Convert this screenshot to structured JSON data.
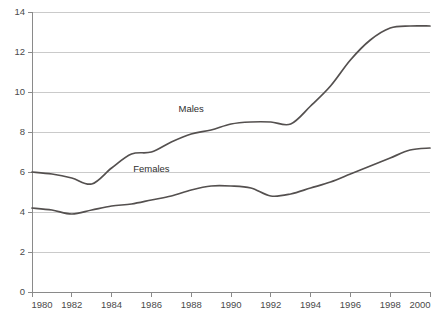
{
  "chart_data": {
    "type": "line",
    "title": "",
    "xlabel": "",
    "ylabel": "",
    "xlim": [
      1980,
      2000
    ],
    "ylim": [
      0,
      14
    ],
    "grid": true,
    "legend_position": "inline-labels",
    "x_ticks": [
      1980,
      1982,
      1984,
      1986,
      1988,
      1990,
      1992,
      1994,
      1996,
      1998,
      2000
    ],
    "y_ticks": [
      0,
      2,
      4,
      6,
      8,
      10,
      12,
      14
    ],
    "x": [
      1980,
      1981,
      1982,
      1983,
      1984,
      1985,
      1986,
      1987,
      1988,
      1989,
      1990,
      1991,
      1992,
      1993,
      1994,
      1995,
      1996,
      1997,
      1998,
      1999,
      2000
    ],
    "series": [
      {
        "name": "Males",
        "color": "#54504f",
        "values": [
          6.0,
          5.9,
          5.7,
          5.4,
          6.2,
          6.9,
          7.0,
          7.5,
          7.9,
          8.1,
          8.4,
          8.5,
          8.5,
          8.4,
          9.3,
          10.3,
          11.6,
          12.6,
          13.2,
          13.3,
          13.3
        ],
        "label_at_x": 1988,
        "label_at_y": 9.0
      },
      {
        "name": "Females",
        "color": "#54504f",
        "values": [
          4.2,
          4.1,
          3.9,
          4.1,
          4.3,
          4.4,
          4.6,
          4.8,
          5.1,
          5.3,
          5.3,
          5.2,
          4.8,
          4.9,
          5.2,
          5.5,
          5.9,
          6.3,
          6.7,
          7.1,
          7.2
        ],
        "label_at_x": 1986,
        "label_at_y": 6.0
      }
    ]
  },
  "axes": {
    "y_tick_labels": [
      "0",
      "2",
      "4",
      "6",
      "8",
      "10",
      "12",
      "14"
    ],
    "x_tick_labels": [
      "1980",
      "1982",
      "1984",
      "1986",
      "1988",
      "1990",
      "1992",
      "1994",
      "1996",
      "1998",
      "2000"
    ]
  },
  "series_labels": {
    "males": "Males",
    "females": "Females"
  },
  "colors": {
    "line": "#54504f",
    "grid": "#bdbdbd",
    "axis": "#8a8a8a",
    "text": "#4a4a4a",
    "background": "#ffffff"
  },
  "top_caption": ""
}
